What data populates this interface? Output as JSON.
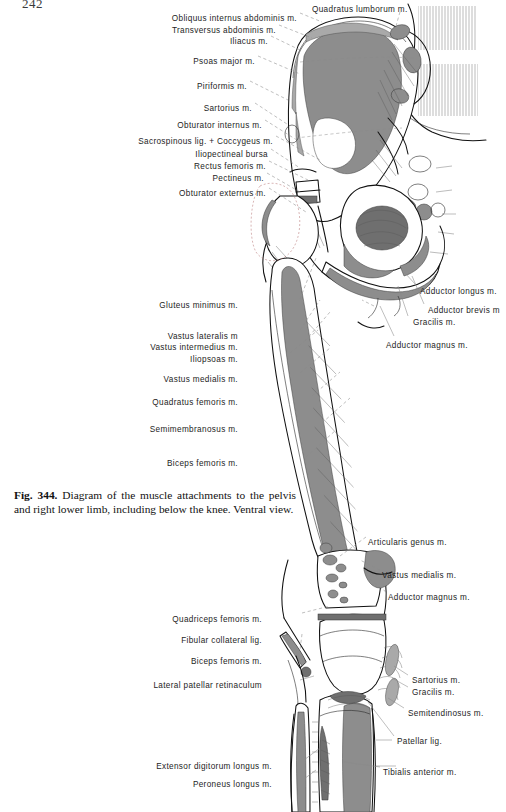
{
  "page": {
    "number": "242",
    "width": 506,
    "height": 812
  },
  "figure": {
    "number": "Fig. 344.",
    "caption": "Diagram of the muscle attachments to the pelvis and right lower limb, including below the knee. Ventral view.",
    "view": "Ventral view",
    "subject": "pelvis and right lower limb"
  },
  "colors": {
    "ink": "#111111",
    "muscle_fill": "#8d8d8d",
    "muscle_fill_dark": "#6f6f6f",
    "muscle_fill_light": "#a9a9a9",
    "bone_fill": "#ffffff",
    "leader_line": "#8a8a8a",
    "page_background": "#ffffff"
  },
  "labels_left": [
    {
      "text": "Obliquus internus abdominis m.",
      "x": 297,
      "y": 14
    },
    {
      "text": "Transversus abdominis m.",
      "x": 276,
      "y": 26
    },
    {
      "text": "Iliacus m.",
      "x": 268,
      "y": 37
    },
    {
      "text": "Psoas major m.",
      "x": 255,
      "y": 57
    },
    {
      "text": "Piriformis m.",
      "x": 247,
      "y": 82
    },
    {
      "text": "Sartorius m.",
      "x": 252,
      "y": 104
    },
    {
      "text": "Obturator internus m.",
      "x": 262,
      "y": 121
    },
    {
      "text": "Sacrospinous lig. + Coccygeus m.",
      "x": 273,
      "y": 137
    },
    {
      "text": "Iliopectineal bursa",
      "x": 268,
      "y": 150
    },
    {
      "text": "Rectus femoris m.",
      "x": 266,
      "y": 162
    },
    {
      "text": "Pectineus m.",
      "x": 264,
      "y": 174
    },
    {
      "text": "Obturator externus m.",
      "x": 266,
      "y": 189
    },
    {
      "text": "Gluteus minimus m.",
      "x": 238,
      "y": 301
    },
    {
      "text": "Vastus lateralis m",
      "x": 238,
      "y": 332
    },
    {
      "text": "Vastus intermedius m.",
      "x": 238,
      "y": 343
    },
    {
      "text": "Iliopsoas m.",
      "x": 238,
      "y": 355
    },
    {
      "text": "Vastus medialis m.",
      "x": 238,
      "y": 375
    },
    {
      "text": "Quadratus femoris m.",
      "x": 238,
      "y": 398
    },
    {
      "text": "Semimembranosus m.",
      "x": 238,
      "y": 425
    },
    {
      "text": "Biceps femoris m.",
      "x": 238,
      "y": 459
    },
    {
      "text": "Quadriceps femoris m.",
      "x": 262,
      "y": 615
    },
    {
      "text": "Fibular collateral lig.",
      "x": 262,
      "y": 636
    },
    {
      "text": "Biceps femoris m.",
      "x": 262,
      "y": 657
    },
    {
      "text": "Lateral patellar retinaculum",
      "x": 262,
      "y": 681
    },
    {
      "text": "Extensor digitorum longus m.",
      "x": 272,
      "y": 762
    },
    {
      "text": "Peroneus longus m.",
      "x": 272,
      "y": 780
    }
  ],
  "labels_right": [
    {
      "text": "Quadratus lumborum m.",
      "x": 312,
      "y": 5
    },
    {
      "text": "Adductor longus m.",
      "x": 420,
      "y": 287
    },
    {
      "text": "Adductor brevis m",
      "x": 428,
      "y": 306
    },
    {
      "text": "Gracilis m.",
      "x": 413,
      "y": 318
    },
    {
      "text": "Adductor magnus m.",
      "x": 386,
      "y": 341
    },
    {
      "text": "Articularis genus m.",
      "x": 368,
      "y": 538
    },
    {
      "text": "Vastus medialis m.",
      "x": 382,
      "y": 571
    },
    {
      "text": "Adductor magnus m.",
      "x": 388,
      "y": 593
    },
    {
      "text": "Sartorius m.",
      "x": 412,
      "y": 676
    },
    {
      "text": "Gracilis m.",
      "x": 412,
      "y": 688
    },
    {
      "text": "Semitendinosus m.",
      "x": 408,
      "y": 709
    },
    {
      "text": "Patellar lig.",
      "x": 397,
      "y": 737
    },
    {
      "text": "Tibialis anterior m.",
      "x": 383,
      "y": 768
    }
  ]
}
